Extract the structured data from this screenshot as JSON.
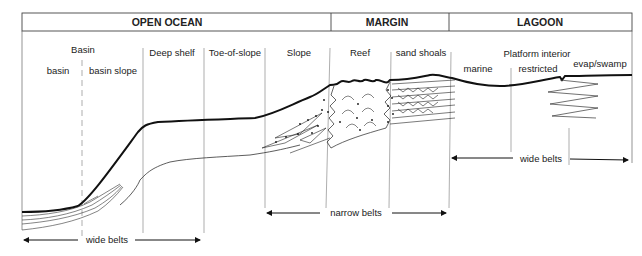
{
  "diagram": {
    "title_bar": {
      "zones": [
        {
          "label": "OPEN OCEAN"
        },
        {
          "label": "MARGIN"
        },
        {
          "label": "LAGOON"
        }
      ]
    },
    "facies": [
      {
        "label": "Basin"
      },
      {
        "label": "basin"
      },
      {
        "label": "basin slope"
      },
      {
        "label": "Deep shelf"
      },
      {
        "label": "Toe-of-slope"
      },
      {
        "label": "Slope"
      },
      {
        "label": "Reef"
      },
      {
        "label": "sand shoals"
      },
      {
        "label": "Platform interior"
      },
      {
        "label": "marine"
      },
      {
        "label": "restricted"
      },
      {
        "label": "evap/swamp"
      }
    ],
    "belts": [
      {
        "label": "wide belts"
      },
      {
        "label": "narrow belts"
      },
      {
        "label": "wide belts"
      }
    ],
    "colors": {
      "line": "#1a1a1a",
      "thin_line": "#555555",
      "background": "#ffffff"
    }
  }
}
